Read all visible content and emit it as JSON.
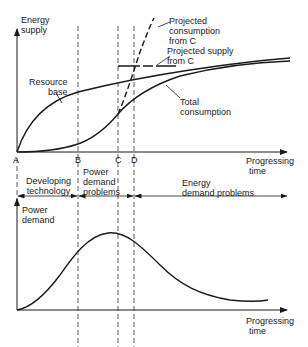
{
  "top_chart": {
    "y_axis_label_line1": "Energy",
    "y_axis_label_line2": "supply",
    "x_axis_label_line1": "Progressing",
    "x_axis_label_line2": "time",
    "points": [
      "A",
      "B",
      "C",
      "D"
    ],
    "curves": {
      "resource_base_line1": "Resource",
      "resource_base_line2": "base",
      "total_consumption_line1": "Total",
      "total_consumption_line2": "consumption",
      "projected_consumption_line1": "Projected",
      "projected_consumption_line2": "consumption",
      "projected_consumption_line3": "from C",
      "projected_supply_line1": "Projected supply",
      "projected_supply_line2": "from C"
    }
  },
  "phases": {
    "developing_line1": "Developing",
    "developing_line2": "technology",
    "power_demand_line1": "Power",
    "power_demand_line2": "demand",
    "power_demand_line3": "problems",
    "energy_demand_line1": "Energy",
    "energy_demand_line2": "demand problems"
  },
  "bottom_chart": {
    "y_axis_label_line1": "Power",
    "y_axis_label_line2": "demand",
    "x_axis_label_line1": "Progressing",
    "x_axis_label_line2": "time"
  },
  "caption": ""
}
